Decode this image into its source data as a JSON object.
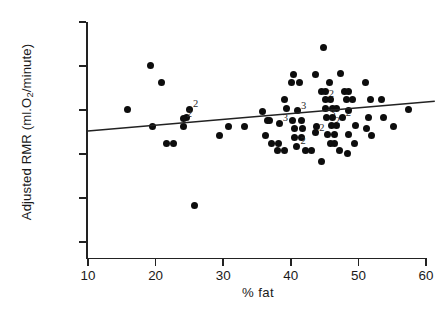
{
  "chart_data": {
    "type": "scatter",
    "title": "",
    "xlabel": "% fat",
    "ylabel": "Adjusted RMR (ml.O2/minute)",
    "ylabel_parts": {
      "pre": "Adjusted RMR (ml.O",
      "sub": "2",
      "post": "/minute)"
    },
    "xlim": [
      10,
      60
    ],
    "ylim": [
      100,
      350
    ],
    "xticks": [
      10,
      20,
      30,
      40,
      50,
      60
    ],
    "yticks": [
      100,
      150,
      200,
      250,
      300,
      350
    ],
    "xtick_labels": [
      "10",
      "20",
      "30",
      "40",
      "50",
      "60"
    ],
    "ytick_labels": [
      "100",
      "150",
      "200",
      "250",
      "300",
      "350"
    ],
    "grid": false,
    "legend": null,
    "marker": "filled-circle",
    "marker_color": "#0d0d0d",
    "regression_line": {
      "x0": 10.0,
      "y0": 226.0,
      "x1": 61.3,
      "y1": 260.0,
      "color": "#222222",
      "description": "least-squares fit, slight positive slope"
    },
    "overlap_labels_note": "Numerals 2 and 3 mark points where that many observations coincide",
    "points": [
      {
        "x": 15.9,
        "y": 251
      },
      {
        "x": 19.3,
        "y": 301
      },
      {
        "x": 20.9,
        "y": 281
      },
      {
        "x": 19.6,
        "y": 231
      },
      {
        "x": 21.6,
        "y": 212
      },
      {
        "x": 22.6,
        "y": 212
      },
      {
        "x": 24.2,
        "y": 231
      },
      {
        "x": 24.6,
        "y": 241
      },
      {
        "x": 25.0,
        "y": 251,
        "label": "2"
      },
      {
        "x": 24.1,
        "y": 240,
        "label": "2"
      },
      {
        "x": 25.8,
        "y": 142
      },
      {
        "x": 29.5,
        "y": 221
      },
      {
        "x": 30.8,
        "y": 231
      },
      {
        "x": 33.1,
        "y": 231
      },
      {
        "x": 35.8,
        "y": 248
      },
      {
        "x": 36.6,
        "y": 238
      },
      {
        "x": 36.9,
        "y": 238
      },
      {
        "x": 36.3,
        "y": 221
      },
      {
        "x": 37.2,
        "y": 212
      },
      {
        "x": 38.2,
        "y": 212
      },
      {
        "x": 38.0,
        "y": 204
      },
      {
        "x": 39.1,
        "y": 204
      },
      {
        "x": 38.3,
        "y": 235,
        "label": "3"
      },
      {
        "x": 39.3,
        "y": 252
      },
      {
        "x": 39.1,
        "y": 262
      },
      {
        "x": 40.1,
        "y": 281
      },
      {
        "x": 41.3,
        "y": 281
      },
      {
        "x": 40.4,
        "y": 290
      },
      {
        "x": 41.0,
        "y": 249,
        "label": "3"
      },
      {
        "x": 40.2,
        "y": 238
      },
      {
        "x": 41.6,
        "y": 238
      },
      {
        "x": 40.6,
        "y": 229
      },
      {
        "x": 41.7,
        "y": 229
      },
      {
        "x": 40.6,
        "y": 219
      },
      {
        "x": 41.6,
        "y": 219
      },
      {
        "x": 40.9,
        "y": 209,
        "label": "2"
      },
      {
        "x": 42.2,
        "y": 204
      },
      {
        "x": 43.0,
        "y": 204
      },
      {
        "x": 43.6,
        "y": 290
      },
      {
        "x": 43.8,
        "y": 231
      },
      {
        "x": 43.7,
        "y": 224,
        "label": "2"
      },
      {
        "x": 44.6,
        "y": 192
      },
      {
        "x": 44.6,
        "y": 271
      },
      {
        "x": 45.2,
        "y": 271
      },
      {
        "x": 45.7,
        "y": 281
      },
      {
        "x": 45.1,
        "y": 262,
        "label": "2"
      },
      {
        "x": 45.9,
        "y": 262
      },
      {
        "x": 45.2,
        "y": 252
      },
      {
        "x": 46.1,
        "y": 252
      },
      {
        "x": 46.8,
        "y": 252
      },
      {
        "x": 45.3,
        "y": 241,
        "label": "3"
      },
      {
        "x": 46.2,
        "y": 241
      },
      {
        "x": 46.0,
        "y": 232,
        "label": "2"
      },
      {
        "x": 46.8,
        "y": 232
      },
      {
        "x": 45.5,
        "y": 222
      },
      {
        "x": 46.4,
        "y": 222
      },
      {
        "x": 45.8,
        "y": 212
      },
      {
        "x": 46.4,
        "y": 212
      },
      {
        "x": 44.8,
        "y": 321
      },
      {
        "x": 47.3,
        "y": 292
      },
      {
        "x": 47.9,
        "y": 271
      },
      {
        "x": 48.6,
        "y": 271
      },
      {
        "x": 48.3,
        "y": 262
      },
      {
        "x": 49.2,
        "y": 262
      },
      {
        "x": 47.6,
        "y": 241,
        "label": "2"
      },
      {
        "x": 48.6,
        "y": 249
      },
      {
        "x": 49.6,
        "y": 232
      },
      {
        "x": 48.5,
        "y": 222
      },
      {
        "x": 49.4,
        "y": 212
      },
      {
        "x": 47.2,
        "y": 204
      },
      {
        "x": 48.4,
        "y": 201
      },
      {
        "x": 51.0,
        "y": 281
      },
      {
        "x": 51.8,
        "y": 262
      },
      {
        "x": 51.5,
        "y": 241
      },
      {
        "x": 51.2,
        "y": 229
      },
      {
        "x": 52.0,
        "y": 221
      },
      {
        "x": 53.4,
        "y": 262
      },
      {
        "x": 53.7,
        "y": 241
      },
      {
        "x": 55.2,
        "y": 231
      },
      {
        "x": 57.4,
        "y": 251
      }
    ]
  }
}
